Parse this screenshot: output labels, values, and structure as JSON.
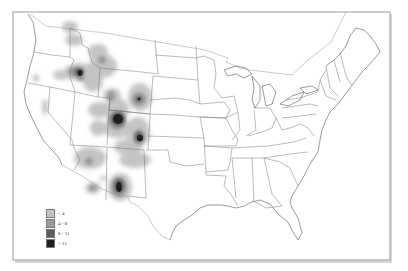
{
  "map": {
    "region": "Contiguous United States",
    "style": "grayscale density map with state boundaries"
  },
  "legend": {
    "items": [
      {
        "label": "< 4",
        "color": "#c4c4c4"
      },
      {
        "label": "4 - 8",
        "color": "#9b9b9b"
      },
      {
        "label": "8 - 11",
        "color": "#5e5e5e"
      },
      {
        "label": "> 11",
        "color": "#1e1e1e"
      }
    ]
  },
  "hotspots": [
    {
      "name": "central-idaho",
      "level": "> 11"
    },
    {
      "name": "western-colorado",
      "level": "> 11"
    },
    {
      "name": "north-central-colorado",
      "level": "> 11"
    },
    {
      "name": "southwest-new-mexico",
      "level": "> 11"
    },
    {
      "name": "northeast-wyoming",
      "level": "8 - 11"
    }
  ]
}
